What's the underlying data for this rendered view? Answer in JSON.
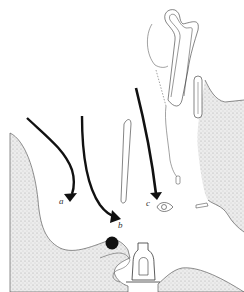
{
  "figure": {
    "type": "anatomical line drawing",
    "labels": [
      {
        "id": "a",
        "text": "a"
      },
      {
        "id": "b",
        "text": "b"
      },
      {
        "id": "c",
        "text": "c"
      }
    ],
    "arrows": [
      {
        "label": "a",
        "description": "curved arrow pointing down to label a"
      },
      {
        "label": "b",
        "description": "long curved arrow pointing to label b"
      },
      {
        "label": "c",
        "description": "straight arrow pointing to label c"
      }
    ],
    "colors": {
      "line": "#222222",
      "stipple_fill": "#d9d9d9",
      "background": "#ffffff"
    }
  }
}
